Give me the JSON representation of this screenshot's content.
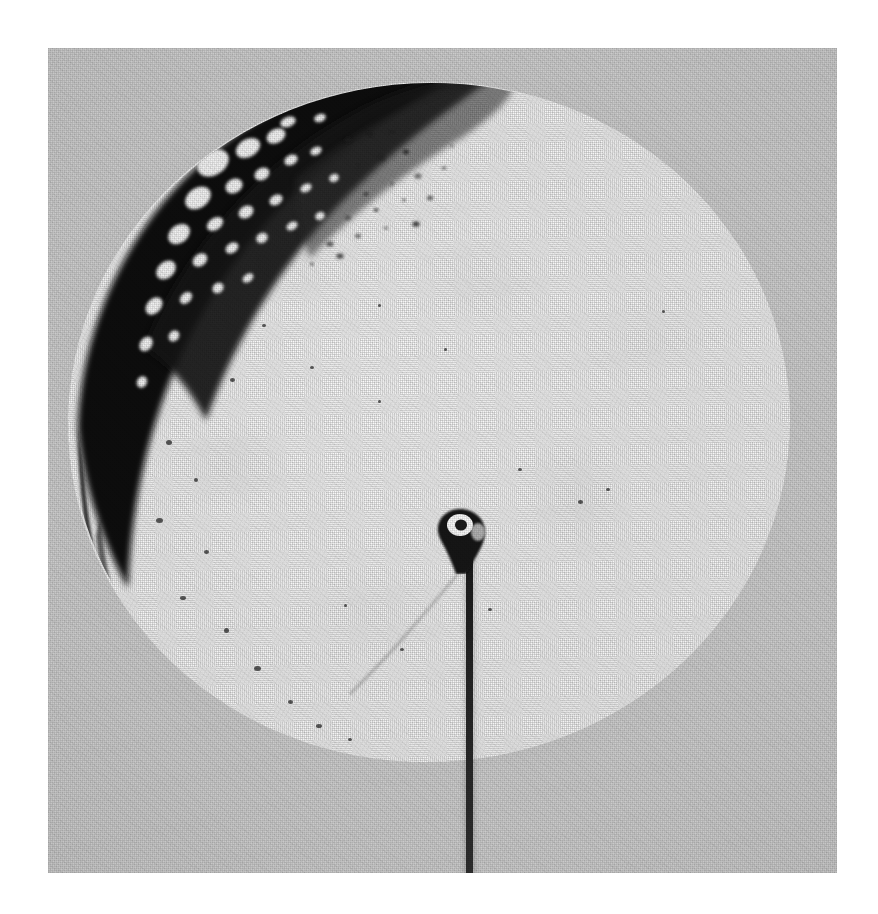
{
  "page": {
    "width": 878,
    "height": 914,
    "background_color": "#ffffff",
    "content_type": "photograph",
    "description": "Black-and-white halftone photograph of a circular specimen cross-section mounted on a thin wire"
  },
  "plate": {
    "x": 48,
    "y": 48,
    "width": 789,
    "height": 825,
    "background_color": "#c9c9c9",
    "label": "photographic-plate"
  },
  "specimen": {
    "shape": "ellipse",
    "center_x": 381,
    "center_y": 374,
    "radius_x": 361,
    "radius_y": 340,
    "rotation_deg": -3,
    "fill_color": "#f6f6f6",
    "edge_color": "#d8d8d8",
    "label": "specimen-disk"
  },
  "crescent": {
    "label": "porous-dark-crescent",
    "position": "upper-left rim",
    "fill_color": "#0d0d0d",
    "void_color": "#f2f2f2",
    "description": "dense black rim band containing rounded bright voids that fade into a dotted transition zone",
    "voids": [
      {
        "cx": 165,
        "cy": 115,
        "rx": 17,
        "ry": 12,
        "rot": -32
      },
      {
        "cx": 200,
        "cy": 100,
        "rx": 13,
        "ry": 9,
        "rot": -30
      },
      {
        "cx": 228,
        "cy": 88,
        "rx": 10,
        "ry": 7,
        "rot": -28
      },
      {
        "cx": 150,
        "cy": 150,
        "rx": 14,
        "ry": 10,
        "rot": -35
      },
      {
        "cx": 186,
        "cy": 138,
        "rx": 9,
        "ry": 7,
        "rot": -30
      },
      {
        "cx": 214,
        "cy": 126,
        "rx": 8,
        "ry": 6,
        "rot": -30
      },
      {
        "cx": 243,
        "cy": 112,
        "rx": 7,
        "ry": 5,
        "rot": -28
      },
      {
        "cx": 268,
        "cy": 103,
        "rx": 6,
        "ry": 4,
        "rot": -25
      },
      {
        "cx": 131,
        "cy": 186,
        "rx": 12,
        "ry": 9,
        "rot": -38
      },
      {
        "cx": 167,
        "cy": 176,
        "rx": 9,
        "ry": 6,
        "rot": -34
      },
      {
        "cx": 198,
        "cy": 164,
        "rx": 8,
        "ry": 6,
        "rot": -32
      },
      {
        "cx": 228,
        "cy": 152,
        "rx": 7,
        "ry": 5,
        "rot": -30
      },
      {
        "cx": 258,
        "cy": 140,
        "rx": 6,
        "ry": 4,
        "rot": -28
      },
      {
        "cx": 286,
        "cy": 130,
        "rx": 5,
        "ry": 4,
        "rot": -26
      },
      {
        "cx": 118,
        "cy": 222,
        "rx": 11,
        "ry": 8,
        "rot": -42
      },
      {
        "cx": 152,
        "cy": 212,
        "rx": 8,
        "ry": 6,
        "rot": -38
      },
      {
        "cx": 184,
        "cy": 200,
        "rx": 7,
        "ry": 5,
        "rot": -34
      },
      {
        "cx": 214,
        "cy": 190,
        "rx": 6,
        "ry": 5,
        "rot": -32
      },
      {
        "cx": 244,
        "cy": 178,
        "rx": 6,
        "ry": 4,
        "rot": -30
      },
      {
        "cx": 272,
        "cy": 168,
        "rx": 5,
        "ry": 4,
        "rot": -28
      },
      {
        "cx": 106,
        "cy": 258,
        "rx": 10,
        "ry": 7,
        "rot": -48
      },
      {
        "cx": 138,
        "cy": 250,
        "rx": 7,
        "ry": 5,
        "rot": -44
      },
      {
        "cx": 170,
        "cy": 240,
        "rx": 6,
        "ry": 5,
        "rot": -40
      },
      {
        "cx": 200,
        "cy": 230,
        "rx": 6,
        "ry": 4,
        "rot": -36
      },
      {
        "cx": 98,
        "cy": 296,
        "rx": 8,
        "ry": 6,
        "rot": -55
      },
      {
        "cx": 126,
        "cy": 288,
        "rx": 6,
        "ry": 5,
        "rot": -50
      },
      {
        "cx": 94,
        "cy": 334,
        "rx": 6,
        "ry": 5,
        "rot": -62
      },
      {
        "cx": 240,
        "cy": 74,
        "rx": 8,
        "ry": 5,
        "rot": -22
      },
      {
        "cx": 272,
        "cy": 70,
        "rx": 6,
        "ry": 4,
        "rot": -20
      }
    ],
    "transition_dots": [
      {
        "cx": 300,
        "cy": 92
      },
      {
        "cx": 322,
        "cy": 86
      },
      {
        "cx": 344,
        "cy": 84
      },
      {
        "cx": 310,
        "cy": 118
      },
      {
        "cx": 334,
        "cy": 110
      },
      {
        "cx": 358,
        "cy": 104
      },
      {
        "cx": 318,
        "cy": 146
      },
      {
        "cx": 344,
        "cy": 136
      },
      {
        "cx": 370,
        "cy": 128
      },
      {
        "cx": 300,
        "cy": 170
      },
      {
        "cx": 328,
        "cy": 162
      },
      {
        "cx": 356,
        "cy": 152
      },
      {
        "cx": 282,
        "cy": 196
      },
      {
        "cx": 310,
        "cy": 188
      },
      {
        "cx": 338,
        "cy": 180
      },
      {
        "cx": 264,
        "cy": 216
      },
      {
        "cx": 292,
        "cy": 208
      },
      {
        "cx": 382,
        "cy": 150
      },
      {
        "cx": 396,
        "cy": 120
      },
      {
        "cx": 404,
        "cy": 98
      },
      {
        "cx": 368,
        "cy": 176
      }
    ]
  },
  "mount": {
    "label": "wire-mount",
    "hub_x": 382,
    "hub_y": 458,
    "hub_width": 62,
    "hub_height": 68,
    "hub_color": "#141414",
    "highlight_color": "#fdfdfd",
    "wire_x": 418,
    "wire_top": 500,
    "wire_length": 375,
    "wire_width": 7,
    "wire_color": "#1f1f1f",
    "description": "dark conical mounting blob with a bright annular highlight, a thin wire running straight down past the lower edge of the plate"
  },
  "crack": {
    "label": "radial-crack",
    "color": "rgba(90,90,90,0.55)",
    "description": "faint hairline crack curving from the mounting hub down and to the left"
  },
  "flecks": [
    {
      "x": 182,
      "y": 330,
      "w": 5,
      "h": 4
    },
    {
      "x": 118,
      "y": 392,
      "w": 6,
      "h": 5
    },
    {
      "x": 146,
      "y": 430,
      "w": 4,
      "h": 4
    },
    {
      "x": 108,
      "y": 470,
      "w": 7,
      "h": 5
    },
    {
      "x": 156,
      "y": 502,
      "w": 5,
      "h": 4
    },
    {
      "x": 132,
      "y": 548,
      "w": 6,
      "h": 4
    },
    {
      "x": 176,
      "y": 580,
      "w": 5,
      "h": 5
    },
    {
      "x": 206,
      "y": 618,
      "w": 7,
      "h": 5
    },
    {
      "x": 240,
      "y": 652,
      "w": 5,
      "h": 4
    },
    {
      "x": 268,
      "y": 676,
      "w": 6,
      "h": 4
    },
    {
      "x": 300,
      "y": 690,
      "w": 4,
      "h": 3
    },
    {
      "x": 214,
      "y": 276,
      "w": 4,
      "h": 3
    },
    {
      "x": 262,
      "y": 318,
      "w": 4,
      "h": 3
    },
    {
      "x": 330,
      "y": 352,
      "w": 3,
      "h": 3
    },
    {
      "x": 396,
      "y": 300,
      "w": 3,
      "h": 3
    },
    {
      "x": 470,
      "y": 420,
      "w": 4,
      "h": 3
    },
    {
      "x": 530,
      "y": 452,
      "w": 5,
      "h": 4
    },
    {
      "x": 558,
      "y": 440,
      "w": 4,
      "h": 3
    },
    {
      "x": 440,
      "y": 560,
      "w": 4,
      "h": 3
    },
    {
      "x": 352,
      "y": 600,
      "w": 4,
      "h": 3
    },
    {
      "x": 296,
      "y": 556,
      "w": 3,
      "h": 3
    },
    {
      "x": 614,
      "y": 262,
      "w": 3,
      "h": 3
    },
    {
      "x": 330,
      "y": 256,
      "w": 3,
      "h": 3
    }
  ]
}
